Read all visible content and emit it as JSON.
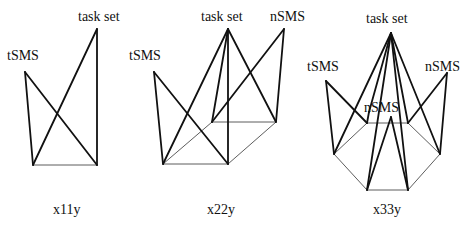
{
  "figures": [
    {
      "caption": "x11y",
      "labels": {
        "top": "task set",
        "left": "tSMS"
      }
    },
    {
      "caption": "x22y",
      "labels": {
        "top": "task set",
        "left": "tSMS",
        "right": "nSMS"
      }
    },
    {
      "caption": "x33y",
      "labels": {
        "top": "task set",
        "left": "tSMS",
        "right": "nSMS",
        "middle": "nSMS"
      }
    }
  ]
}
